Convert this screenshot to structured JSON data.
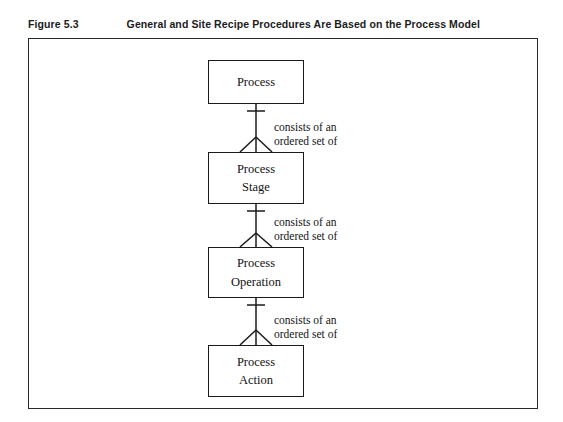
{
  "caption": {
    "number": "Figure 5.3",
    "title": "General and Site Recipe Procedures Are Based on the Process Model"
  },
  "figure": {
    "border_color": "#2a2a2a",
    "background": "#ffffff"
  },
  "diagram": {
    "type": "entity-relationship",
    "line_color": "#1a1a1a",
    "boxes": [
      {
        "id": "process",
        "line1": "Process",
        "line2": ""
      },
      {
        "id": "process-stage",
        "line1": "Process",
        "line2": "Stage"
      },
      {
        "id": "process-operation",
        "line1": "Process",
        "line2": "Operation"
      },
      {
        "id": "process-action",
        "line1": "Process",
        "line2": "Action"
      }
    ],
    "relationships": [
      {
        "id": "rel-1",
        "from": "process",
        "to": "process-stage",
        "line1": "consists of an",
        "line2": "ordered set of",
        "from_cardinality": "one",
        "to_cardinality": "many"
      },
      {
        "id": "rel-2",
        "from": "process-stage",
        "to": "process-operation",
        "line1": "consists of an",
        "line2": "ordered set of",
        "from_cardinality": "one",
        "to_cardinality": "many"
      },
      {
        "id": "rel-3",
        "from": "process-operation",
        "to": "process-action",
        "line1": "consists of an",
        "line2": "ordered set of",
        "from_cardinality": "one",
        "to_cardinality": "many"
      }
    ]
  }
}
